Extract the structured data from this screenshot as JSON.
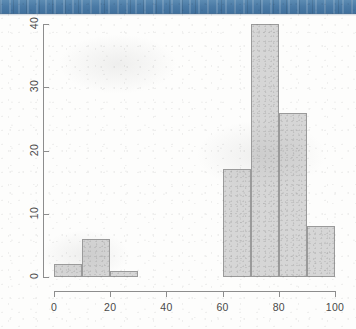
{
  "page": {
    "background_color": "#fdfdfc",
    "banner_color": "#4b7ba6"
  },
  "chart_data": {
    "type": "bar",
    "chart_subtype": "histogram",
    "title": "",
    "subtitle": "",
    "xlabel": "",
    "ylabel": "",
    "xlim": [
      0,
      100
    ],
    "ylim": [
      0,
      40
    ],
    "xticks": [
      0,
      20,
      40,
      60,
      80,
      100
    ],
    "yticks": [
      0,
      10,
      20,
      30,
      40
    ],
    "xtick_labels": [
      "0",
      "20",
      "40",
      "60",
      "80",
      "100"
    ],
    "ytick_labels": [
      "0",
      "10",
      "20",
      "30",
      "40"
    ],
    "grid": false,
    "legend": false,
    "legend_position": "none",
    "bin_width": 10,
    "bin_edges": [
      0,
      10,
      20,
      30,
      40,
      50,
      60,
      70,
      80,
      90,
      100
    ],
    "categories": [
      "0-10",
      "10-20",
      "20-30",
      "30-40",
      "40-50",
      "50-60",
      "60-70",
      "70-80",
      "80-90",
      "90-100"
    ],
    "values": [
      2,
      6,
      1,
      0,
      0,
      0,
      17,
      40,
      26,
      8
    ],
    "bar_fill_color": "#d6d6d6",
    "bar_edge_color": "#9a9a9a",
    "axis_color": "#8d8d8d",
    "tick_label_color": "#4a4a4a",
    "bars": [
      {
        "label": "0-10",
        "x0": 0,
        "x1": 10,
        "value": 2
      },
      {
        "label": "10-20",
        "x0": 10,
        "x1": 20,
        "value": 6
      },
      {
        "label": "20-30",
        "x0": 20,
        "x1": 30,
        "value": 1
      },
      {
        "label": "30-40",
        "x0": 30,
        "x1": 40,
        "value": 0
      },
      {
        "label": "40-50",
        "x0": 40,
        "x1": 50,
        "value": 0
      },
      {
        "label": "50-60",
        "x0": 50,
        "x1": 60,
        "value": 0
      },
      {
        "label": "60-70",
        "x0": 60,
        "x1": 70,
        "value": 17
      },
      {
        "label": "70-80",
        "x0": 70,
        "x1": 80,
        "value": 40
      },
      {
        "label": "80-90",
        "x0": 80,
        "x1": 90,
        "value": 26
      },
      {
        "label": "90-100",
        "x0": 90,
        "x1": 100,
        "value": 8
      }
    ]
  }
}
